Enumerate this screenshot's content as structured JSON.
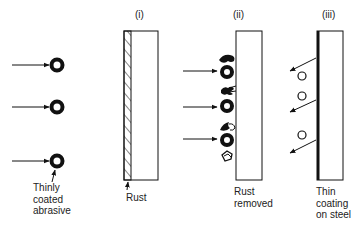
{
  "diagram": {
    "abrasive_label": [
      "Thinly",
      "coated",
      "abrasive"
    ],
    "panels": [
      {
        "id": "i",
        "label": "(i)",
        "caption": [
          "Rust"
        ]
      },
      {
        "id": "ii",
        "label": "(ii)",
        "caption": [
          "Rust",
          "removed"
        ]
      },
      {
        "id": "iii",
        "label": "(iii)",
        "caption": [
          "Thin",
          "coating",
          "on steel"
        ]
      }
    ],
    "colors": {
      "ink": "#111111",
      "background": "#ffffff"
    }
  }
}
